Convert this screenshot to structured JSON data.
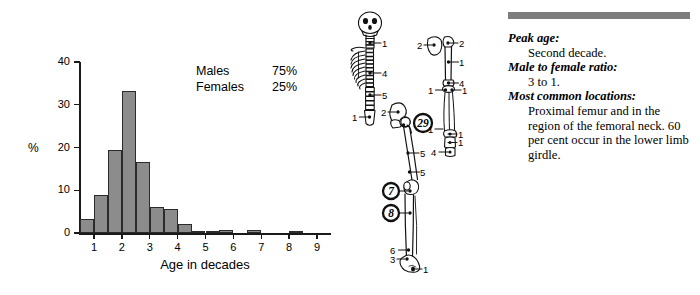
{
  "chart_data": {
    "type": "bar",
    "title": "",
    "xlabel": "Age in decades",
    "ylabel": "%",
    "categories": [
      "0-1",
      "1-2",
      "2-3",
      "3-4",
      "4-5",
      "5-6",
      "6-7",
      "7-8",
      "8-9",
      "9-10",
      "10-11",
      "11-12",
      "12-13",
      "13-14",
      "14-15",
      "15-16",
      "16-17",
      "17-18"
    ],
    "bin_centers": [
      0.75,
      1.25,
      1.75,
      2.25,
      2.75,
      3.25,
      3.75,
      4.25,
      4.75,
      5.25,
      5.75,
      6.25,
      6.75,
      7.25,
      7.75,
      8.25,
      8.75,
      9.25
    ],
    "values": [
      3.2,
      8.8,
      19.5,
      33.3,
      16.5,
      6.0,
      5.5,
      2.2,
      0.5,
      0.5,
      0.7,
      0.0,
      0.7,
      0.0,
      0.0,
      0.4,
      0.0,
      0.0
    ],
    "xlim": [
      0.5,
      9.5
    ],
    "ylim": [
      0,
      40
    ],
    "ytick_values": [
      0,
      10,
      20,
      30,
      40
    ],
    "ytick_labels": [
      "0",
      "10",
      "20",
      "30",
      "40"
    ],
    "xtick_values": [
      1,
      2,
      3,
      4,
      5,
      6,
      7,
      8,
      9
    ],
    "xtick_labels": [
      "1",
      "2",
      "3",
      "4",
      "5",
      "6",
      "7",
      "8",
      "9"
    ],
    "grid": false,
    "bar_color": "#8c8c8c",
    "bar_edge_color": "#2b2b2b",
    "legend_position": "upper-right-inside"
  },
  "legend": {
    "rows": [
      {
        "key": "Males",
        "value": "75%"
      },
      {
        "key": "Females",
        "value": "25%"
      }
    ]
  },
  "skeleton": {
    "caption": "",
    "annotations": [
      {
        "id": "cervical-spine",
        "label": "1"
      },
      {
        "id": "thoracic-spine",
        "label": "4"
      },
      {
        "id": "lumbar-spine",
        "label": "5"
      },
      {
        "id": "sacrum",
        "label": "1"
      },
      {
        "id": "scapula",
        "label": "2"
      },
      {
        "id": "clavicle-humerus-head",
        "label": "2"
      },
      {
        "id": "humerus-shaft",
        "label": "1"
      },
      {
        "id": "distal-humerus",
        "label": "4"
      },
      {
        "id": "proximal-radius",
        "label": "1"
      },
      {
        "id": "proximal-ulna",
        "label": "1"
      },
      {
        "id": "pelvis-ilium",
        "label": "2"
      },
      {
        "id": "proximal-femur",
        "label": "29"
      },
      {
        "id": "distal-radius",
        "label": "1"
      },
      {
        "id": "carpus",
        "label": "1"
      },
      {
        "id": "metacarpal",
        "label": "1"
      },
      {
        "id": "hand-phalanges",
        "label": "4"
      },
      {
        "id": "femur-shaft-upper",
        "label": "5"
      },
      {
        "id": "femur-shaft-lower",
        "label": "5"
      },
      {
        "id": "distal-femur",
        "label": "7"
      },
      {
        "id": "proximal-tibia",
        "label": "8"
      },
      {
        "id": "distal-tibia",
        "label": "6"
      },
      {
        "id": "distal-fibula",
        "label": "3"
      },
      {
        "id": "foot-tarsus",
        "label": "1"
      }
    ]
  },
  "panel": {
    "facts": [
      {
        "label": "Peak age:",
        "value": "Second decade."
      },
      {
        "label": "Male to female ratio:",
        "value": "3 to 1."
      },
      {
        "label": "Most common locations:",
        "value": "Proximal femur and in the region of the femoral neck. 60 per cent occur in the lower limb girdle."
      }
    ]
  },
  "colors": {
    "bar_fill": "#8c8c8c",
    "bar_edge": "#2b2b2b",
    "rule_bar": "#7d7d7d",
    "ink": "#000000",
    "background": "#ffffff"
  }
}
